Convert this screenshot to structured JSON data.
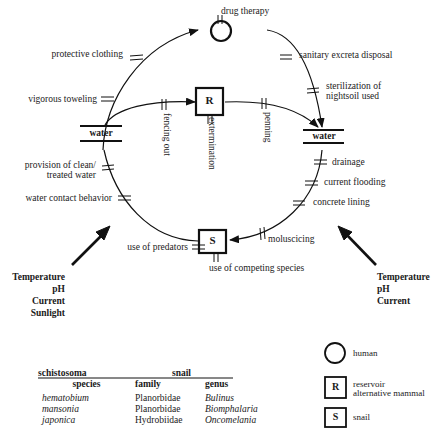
{
  "diagram": {
    "nodes": {
      "human": {
        "symbol": "circle",
        "label": ""
      },
      "reservoir": {
        "symbol": "square",
        "label": "R"
      },
      "snail": {
        "symbol": "square",
        "label": "S"
      },
      "water_left": {
        "label": "water"
      },
      "water_right": {
        "label": "water"
      }
    },
    "interventions": {
      "drug_therapy": "drug therapy",
      "protective_clothing": "protective clothing",
      "vigorous_toweling": "vigorous toweling",
      "sanitary_excreta_disposal": "sanitary excreta disposal",
      "sterilization_line1": "sterilization of",
      "sterilization_line2": "nightsoil used",
      "fencing_out": "fencing out",
      "extermination": "extermination",
      "penning": "penning",
      "provision_line1": "provision of clean/",
      "provision_line2": "treated water",
      "water_contact_behavior": "water contact behavior",
      "drainage": "drainage",
      "current_flooding": "current flooding",
      "concrete_lining": "concrete lining",
      "moluscicing": "moluscicing",
      "use_of_predators": "use of predators",
      "use_of_competing_species": "use of competing species"
    },
    "environment_left": [
      "Temperature",
      "pH",
      "Current",
      "Sunlight"
    ],
    "environment_right": [
      "Temperature",
      "pH",
      "Current"
    ]
  },
  "species_table": {
    "group_headers": {
      "schistosoma": "schistosoma",
      "snail": "snail"
    },
    "columns": [
      "species",
      "family",
      "genus"
    ],
    "rows": [
      {
        "species": "hematobium",
        "family": "Planorbidae",
        "genus": "Bulinus"
      },
      {
        "species": "mansonia",
        "family": "Planorbidae",
        "genus": "Biomphalaria"
      },
      {
        "species": "japonica",
        "family": "Hydrobiidae",
        "genus": "Oncomelania"
      }
    ]
  },
  "legend": {
    "human": {
      "symbol": "",
      "label": "human"
    },
    "reservoir": {
      "symbol": "R",
      "label_line1": "reservoir",
      "label_line2": "alternative mammal"
    },
    "snail": {
      "symbol": "S",
      "label": "snail"
    }
  }
}
